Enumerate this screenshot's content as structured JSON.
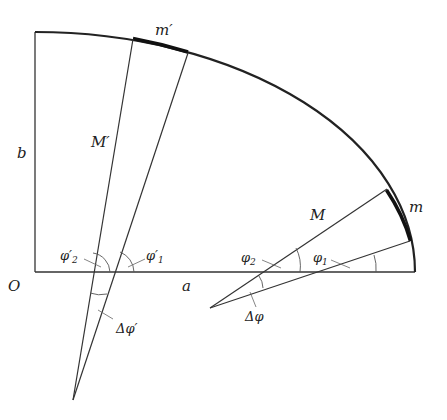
{
  "diagram": {
    "type": "ellipse-quadrant-projection",
    "labels": {
      "m_prime": "m′",
      "M_prime": "M′",
      "b": "b",
      "O": "O",
      "a": "a",
      "M": "M",
      "m": "m",
      "phi2_prime": "φ′",
      "phi2_prime_sub": "2",
      "phi1_prime": "φ′",
      "phi1_prime_sub": "1",
      "phi2": "φ",
      "phi2_sub": "2",
      "phi1": "φ",
      "phi1_sub": "1",
      "delta_phi_prime": "Δφ′",
      "delta_phi": "Δφ"
    },
    "points": {
      "O": [
        35,
        272
      ],
      "top": [
        35,
        32
      ],
      "right": [
        415,
        272
      ],
      "apex_prime": [
        73,
        400
      ],
      "apex": [
        210,
        308
      ],
      "mprime_start": [
        133,
        39
      ],
      "mprime_end": [
        188,
        53
      ],
      "m_start": [
        387,
        189
      ],
      "m_end": [
        410,
        241
      ]
    },
    "colors": {
      "line": "#222222",
      "text": "#222222",
      "background": "#ffffff"
    }
  }
}
